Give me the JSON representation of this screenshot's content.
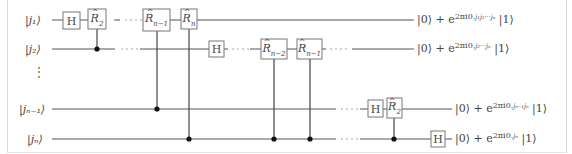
{
  "diagram": {
    "type": "quantum-circuit",
    "title_visible": false,
    "inputs": [
      {
        "id": "j1",
        "label": "|j₁⟩",
        "y": 20
      },
      {
        "id": "j2",
        "label": "|j₂⟩",
        "y": 49
      },
      {
        "id": "jn-1",
        "label": "|jₙ₋₁⟩",
        "y": 109
      },
      {
        "id": "jn",
        "label": "|jₙ⟩",
        "y": 139
      }
    ],
    "vertical_ellipsis": "⋮",
    "gates": [
      {
        "wire": "j1",
        "label": "H"
      },
      {
        "wire": "j1",
        "label": "R̂₂",
        "control": "j2"
      },
      {
        "wire": "j1",
        "label": "R̂ₙ₋₁",
        "control": "jn-1"
      },
      {
        "wire": "j1",
        "label": "R̂ₙ",
        "control": "jn"
      },
      {
        "wire": "j2",
        "label": "H"
      },
      {
        "wire": "j2",
        "label": "R̂ₙ₋₂",
        "control": "jn-1"
      },
      {
        "wire": "j2",
        "label": "R̂ₙ₋₁",
        "control": "jn"
      },
      {
        "wire": "jn-1",
        "label": "H"
      },
      {
        "wire": "jn-1",
        "label": "R̂₂",
        "control": "jn"
      },
      {
        "wire": "jn",
        "label": "H"
      }
    ],
    "gate_labels": {
      "H": "H",
      "R": "R",
      "sub_2": "2",
      "sub_n": "n",
      "sub_n1": "n−1",
      "sub_n2": "n−2"
    },
    "outputs": [
      {
        "wire": "j1",
        "prefix": "|0⟩ + e",
        "exponent": "2πi0.",
        "exp_vars": "j₁j₂···jₙ",
        "suffix": "|1⟩"
      },
      {
        "wire": "j2",
        "prefix": "|0⟩ + e",
        "exponent": "2πi0.",
        "exp_vars": "j₂···jₙ",
        "suffix": "|1⟩"
      },
      {
        "wire": "jn-1",
        "prefix": "|0⟩ + e",
        "exponent": "2πi0.",
        "exp_vars": "jₙ₋₁jₙ",
        "suffix": "|1⟩"
      },
      {
        "wire": "jn",
        "prefix": "|0⟩ + e",
        "exponent": "2πi0.",
        "exp_vars": "jₙ",
        "suffix": "|1⟩"
      }
    ]
  }
}
